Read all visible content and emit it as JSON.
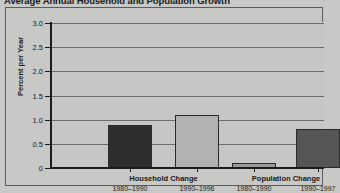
{
  "chart_data": {
    "type": "bar",
    "title": "Average Annual Household and Population Growth",
    "xlabel": "",
    "ylabel": "Percent per Year",
    "ylim": [
      0,
      3.0
    ],
    "ytick_labels": [
      "0",
      "0.5",
      "1.0",
      "1.5",
      "2.0",
      "2.5",
      "3.0"
    ],
    "ytick_values": [
      0,
      0.5,
      1.0,
      1.5,
      2.0,
      2.5,
      3.0
    ],
    "grid": "horizontal",
    "legend": "none",
    "groups": [
      {
        "name": "Household Change",
        "bars": [
          {
            "period": "1980–1990",
            "value": 0.9,
            "color": "#2e2e2e"
          },
          {
            "period": "1990–1996",
            "value": 1.1,
            "color": "#b2b2b0"
          }
        ]
      },
      {
        "name": "Population Change",
        "bars": [
          {
            "period": "1980–1990",
            "value": 0.1,
            "color": "#9a9a98"
          },
          {
            "period": "1990–1997",
            "value": 0.8,
            "color": "#555553"
          }
        ]
      }
    ],
    "categories": [
      "Household Change 1980–1990",
      "Household Change 1990–1996",
      "Population Change 1980–1990",
      "Population Change 1990–1997"
    ],
    "values": [
      0.9,
      1.1,
      0.1,
      0.8
    ]
  },
  "colors": {
    "background": "#c8c8c6",
    "plot_background": "#c6c6c4",
    "gridline": "#6e6e6e",
    "axis": "#1a1a1a",
    "frame": "#5c5c5c",
    "text": "#1a1a1a"
  }
}
